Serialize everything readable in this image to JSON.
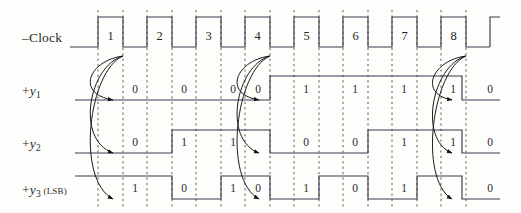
{
  "figure": {
    "background_color": "#fdfdfb",
    "wave_color": "#3a3a52",
    "dash_color": "#6b5a42",
    "arrow_color": "#1a1a1a",
    "text_color": "#232323"
  },
  "rows": [
    {
      "id": "clock",
      "label_prefix": "–",
      "label_name": "Clock",
      "label_sub": "",
      "label_suffix": "",
      "baseline_y": 47,
      "high_y": 17
    },
    {
      "id": "y1",
      "label_prefix": "+",
      "label_name": "y",
      "label_sub": "1",
      "label_suffix": "",
      "baseline_y": 100,
      "high_y": 76
    },
    {
      "id": "y2",
      "label_prefix": "+",
      "label_name": "y",
      "label_sub": "2",
      "label_suffix": "",
      "baseline_y": 153,
      "high_y": 130
    },
    {
      "id": "y3",
      "label_prefix": "+",
      "label_name": "y",
      "label_sub": "3",
      "label_suffix": " (LSB)",
      "baseline_y": 199,
      "high_y": 176
    }
  ],
  "clock": {
    "cycle_numbers": [
      "1",
      "2",
      "3",
      "4",
      "5",
      "6",
      "7",
      "8"
    ],
    "number_y": 36,
    "period": 49,
    "rise_x": [
      98,
      147,
      196,
      245,
      294,
      343,
      392,
      441
    ],
    "fall_x": [
      123,
      172,
      221,
      270,
      319,
      368,
      417,
      466
    ],
    "start_x": 70,
    "end_x": 500
  },
  "dashed_lines": {
    "x": [
      98,
      123,
      147,
      172,
      196,
      221,
      245,
      270,
      294,
      319,
      343,
      368,
      392,
      417,
      441,
      466
    ],
    "top_y": 10,
    "bottom_y": 208
  },
  "waveforms": {
    "y1": {
      "values": [
        "0",
        "0",
        "0",
        "0",
        "1",
        "1",
        "1",
        "1",
        "0"
      ],
      "level_sequence": [
        0,
        0,
        0,
        0,
        1,
        1,
        1,
        1,
        0
      ],
      "transitions": [
        {
          "x": 270,
          "to": 1
        },
        {
          "x": 462,
          "to": 0
        }
      ],
      "label_x": [
        135,
        184,
        233,
        258,
        306,
        355,
        404,
        453,
        490
      ]
    },
    "y2": {
      "values": [
        "0",
        "1",
        "1",
        "0",
        "0",
        "1",
        "1",
        "0"
      ],
      "level_sequence": [
        0,
        1,
        1,
        0,
        0,
        1,
        1,
        0
      ],
      "transitions": [
        {
          "x": 172,
          "to": 1
        },
        {
          "x": 270,
          "to": 0
        },
        {
          "x": 368,
          "to": 1
        },
        {
          "x": 462,
          "to": 0
        }
      ],
      "label_x": [
        135,
        184,
        233,
        306,
        355,
        404,
        453,
        490
      ]
    },
    "y3": {
      "values": [
        "1",
        "0",
        "1",
        "0",
        "1",
        "0",
        "1",
        "0"
      ],
      "level_sequence": [
        1,
        0,
        1,
        0,
        1,
        0,
        1,
        0
      ],
      "transitions": [
        {
          "x": 123,
          "to": 1
        },
        {
          "x": 172,
          "to": 0
        },
        {
          "x": 221,
          "to": 1
        },
        {
          "x": 270,
          "to": 0
        },
        {
          "x": 319,
          "to": 1
        },
        {
          "x": 368,
          "to": 0
        },
        {
          "x": 417,
          "to": 1
        },
        {
          "x": 462,
          "to": 0
        }
      ],
      "label_x": [
        135,
        184,
        233,
        258,
        306,
        355,
        404,
        490
      ]
    }
  },
  "arrows": {
    "description": "Curved causality arrows from clock falling edge to each flip-flop output transition",
    "groups": [
      {
        "source_x": 123,
        "source_y": 56,
        "targets": [
          {
            "x": 122,
            "y": 100
          },
          {
            "x": 122,
            "y": 153
          },
          {
            "x": 122,
            "y": 199
          }
        ]
      },
      {
        "source_x": 270,
        "source_y": 56,
        "targets": [
          {
            "x": 268,
            "y": 100
          },
          {
            "x": 268,
            "y": 153
          },
          {
            "x": 268,
            "y": 199
          }
        ]
      },
      {
        "source_x": 466,
        "source_y": 56,
        "targets": [
          {
            "x": 461,
            "y": 100
          },
          {
            "x": 461,
            "y": 153
          },
          {
            "x": 461,
            "y": 199
          }
        ]
      }
    ]
  }
}
